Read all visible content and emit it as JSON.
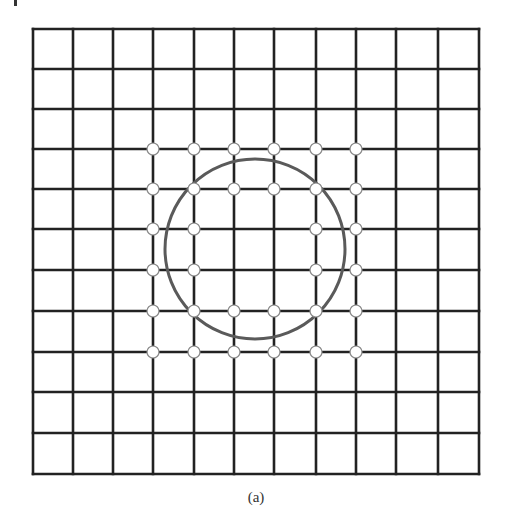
{
  "figure": {
    "caption": "(a)",
    "background": "#ffffff"
  },
  "grid": {
    "cells_x": 11,
    "cells_y": 11,
    "x_lines": [
      33,
      73,
      113,
      153,
      194,
      234,
      274,
      316,
      356,
      396,
      438,
      479
    ],
    "y_lines": [
      29,
      69,
      109,
      149,
      189,
      229,
      270,
      311,
      352,
      392,
      433,
      474
    ],
    "line_color": "#222222",
    "line_width": 2.6
  },
  "circle": {
    "cx": 255,
    "cy": 249,
    "r": 90,
    "stroke": "#5a5a5a",
    "stroke_width": 3
  },
  "nodes": {
    "radius": 6,
    "fill": "#ffffff",
    "stroke": "#8a8a8a",
    "columns": [
      153,
      194,
      234,
      274,
      316,
      356
    ],
    "rows": [
      149,
      189,
      229,
      270,
      311,
      352
    ],
    "pattern": [
      [
        1,
        1,
        1,
        1,
        1,
        1
      ],
      [
        1,
        1,
        1,
        1,
        1,
        1
      ],
      [
        1,
        1,
        0,
        0,
        1,
        1
      ],
      [
        1,
        1,
        0,
        0,
        1,
        1
      ],
      [
        1,
        1,
        1,
        1,
        1,
        1
      ],
      [
        1,
        1,
        1,
        1,
        1,
        1
      ]
    ]
  },
  "corner_mark": {
    "x": 14,
    "y": 0,
    "w": 3,
    "h": 6,
    "color": "#333333"
  }
}
